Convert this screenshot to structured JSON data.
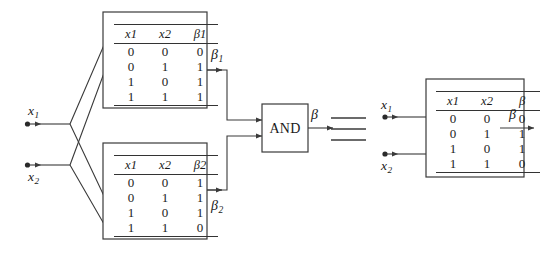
{
  "figure": {
    "stroke_color": "#3a3a3a",
    "text_color": "#1a1a1a",
    "background": "#ffffff"
  },
  "inputs_left": [
    {
      "name": "x1",
      "label": "x",
      "sub": "1"
    },
    {
      "name": "x2",
      "label": "x",
      "sub": "2"
    }
  ],
  "inputs_right": [
    {
      "name": "x1",
      "label": "x",
      "sub": "1"
    },
    {
      "name": "x2",
      "label": "x",
      "sub": "2"
    }
  ],
  "table_upper": {
    "name": "beta1-truth-table",
    "headers": [
      {
        "label": "x",
        "sub": "1"
      },
      {
        "label": "x",
        "sub": "2"
      },
      {
        "label": "β",
        "sub": "1"
      }
    ],
    "rows": [
      [
        "0",
        "0",
        "0"
      ],
      [
        "0",
        "1",
        "1"
      ],
      [
        "1",
        "0",
        "1"
      ],
      [
        "1",
        "1",
        "1"
      ]
    ]
  },
  "table_lower": {
    "name": "beta2-truth-table",
    "headers": [
      {
        "label": "x",
        "sub": "1"
      },
      {
        "label": "x",
        "sub": "2"
      },
      {
        "label": "β",
        "sub": "2"
      }
    ],
    "rows": [
      [
        "0",
        "0",
        "1"
      ],
      [
        "0",
        "1",
        "1"
      ],
      [
        "1",
        "0",
        "1"
      ],
      [
        "1",
        "1",
        "0"
      ]
    ]
  },
  "table_right": {
    "name": "beta-truth-table",
    "headers": [
      {
        "label": "x",
        "sub": "1"
      },
      {
        "label": "x",
        "sub": "2"
      },
      {
        "label": "β",
        "sub": ""
      }
    ],
    "rows": [
      [
        "0",
        "0",
        "0"
      ],
      [
        "0",
        "1",
        "1"
      ],
      [
        "1",
        "0",
        "1"
      ],
      [
        "1",
        "1",
        "0"
      ]
    ]
  },
  "gate": {
    "name": "and-gate",
    "label": "AND"
  },
  "equivalence": {
    "name": "equivalence-symbol",
    "glyph": "≡"
  },
  "outputs": [
    {
      "name": "beta1-output",
      "label": "β",
      "sub": "1"
    },
    {
      "name": "beta2-output",
      "label": "β",
      "sub": "2"
    },
    {
      "name": "beta-gate-output",
      "label": "β",
      "sub": ""
    },
    {
      "name": "beta-right-output",
      "label": "β",
      "sub": ""
    }
  ]
}
